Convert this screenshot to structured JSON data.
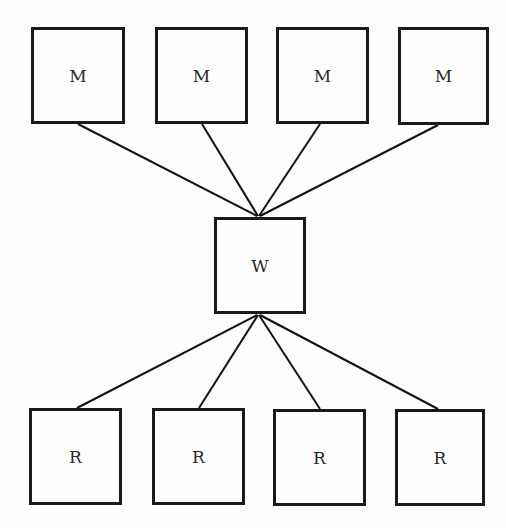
{
  "diagram": {
    "type": "hub-and-spoke",
    "colors": {
      "stroke": "#1a1a1a",
      "background": "#fdfdfc",
      "text": "#2a2a2a"
    },
    "hub": {
      "id": "W",
      "label": "W",
      "x": 214,
      "y": 217,
      "w": 92,
      "h": 97
    },
    "top_nodes": [
      {
        "id": "M1",
        "label": "M",
        "x": 31,
        "y": 27,
        "w": 94,
        "h": 97
      },
      {
        "id": "M2",
        "label": "M",
        "x": 155,
        "y": 27,
        "w": 93,
        "h": 97
      },
      {
        "id": "M3",
        "label": "M",
        "x": 276,
        "y": 27,
        "w": 93,
        "h": 97
      },
      {
        "id": "M4",
        "label": "M",
        "x": 398,
        "y": 27,
        "w": 91,
        "h": 98
      }
    ],
    "bottom_nodes": [
      {
        "id": "R1",
        "label": "R",
        "x": 29,
        "y": 408,
        "w": 93,
        "h": 97
      },
      {
        "id": "R2",
        "label": "R",
        "x": 152,
        "y": 408,
        "w": 93,
        "h": 97
      },
      {
        "id": "R3",
        "label": "R",
        "x": 273,
        "y": 409,
        "w": 93,
        "h": 97
      },
      {
        "id": "R4",
        "label": "R",
        "x": 395,
        "y": 409,
        "w": 90,
        "h": 97
      }
    ],
    "edges": [
      {
        "from": "M1",
        "to": "W",
        "x1": 78,
        "y1": 124,
        "x2": 257,
        "y2": 216
      },
      {
        "from": "M2",
        "to": "W",
        "x1": 202,
        "y1": 124,
        "x2": 258,
        "y2": 216
      },
      {
        "from": "M3",
        "to": "W",
        "x1": 320,
        "y1": 124,
        "x2": 259,
        "y2": 216
      },
      {
        "from": "M4",
        "to": "W",
        "x1": 438,
        "y1": 125,
        "x2": 260,
        "y2": 216
      },
      {
        "from": "W",
        "to": "R1",
        "x1": 257,
        "y1": 315,
        "x2": 77,
        "y2": 408
      },
      {
        "from": "W",
        "to": "R2",
        "x1": 258,
        "y1": 315,
        "x2": 199,
        "y2": 408
      },
      {
        "from": "W",
        "to": "R3",
        "x1": 259,
        "y1": 315,
        "x2": 320,
        "y2": 409
      },
      {
        "from": "W",
        "to": "R4",
        "x1": 260,
        "y1": 315,
        "x2": 438,
        "y2": 409
      }
    ]
  }
}
